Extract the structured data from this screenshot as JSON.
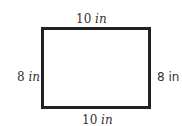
{
  "diagram": {
    "shape": "rectangle",
    "labels": {
      "top": {
        "value": "10",
        "unit": "in"
      },
      "bottom": {
        "value": "10",
        "unit": "in"
      },
      "left": {
        "value": "8",
        "unit": "in"
      },
      "right": {
        "value": "8",
        "unit": "in"
      }
    }
  }
}
